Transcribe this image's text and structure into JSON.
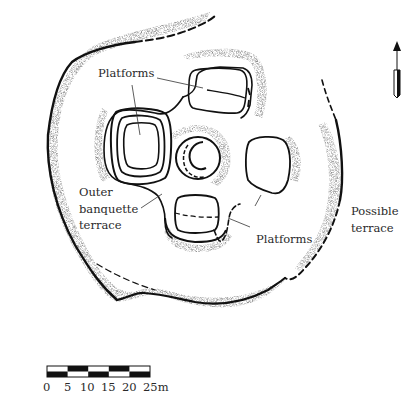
{
  "diagram": {
    "type": "archaeological site plan",
    "labels": {
      "platforms_top": "Platforms",
      "platforms_bottom": "Platforms",
      "outer_banquette_line1": "Outer",
      "outer_banquette_line2": "banquette",
      "outer_banquette_line3": "terrace",
      "possible_terrace_line1": "Possible",
      "possible_terrace_line2": "terrace"
    },
    "features": [
      {
        "name": "outer-enclosure-edge",
        "style": "solid with stippled slope, dashed segments"
      },
      {
        "name": "platform-north",
        "style": "rounded rectangle with internal division line"
      },
      {
        "name": "platform-west",
        "style": "rounded square with concentric terrace rings"
      },
      {
        "name": "central-mound",
        "style": "circular mound with inner crescent"
      },
      {
        "name": "platform-east",
        "style": "rounded square"
      },
      {
        "name": "platform-south",
        "style": "rounded rectangle with dashed internal line"
      },
      {
        "name": "possible-terrace-line",
        "style": "dashed then solid arc"
      }
    ],
    "north_arrow": {
      "direction": "N",
      "glyph": "arrow-up"
    },
    "scale_bar": {
      "ticks": [
        "0",
        "5",
        "10",
        "15",
        "20",
        "25m"
      ],
      "unit": "m",
      "max": 25,
      "segment_count": 5
    },
    "colors": {
      "ink": "#111111",
      "label": "#2a2a2a",
      "background": "#ffffff"
    }
  }
}
